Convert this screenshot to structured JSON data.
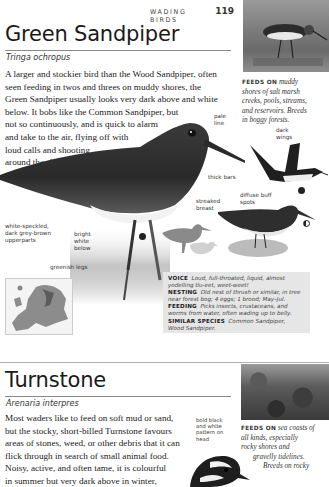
{
  "running_head": {
    "section": "WADING BIRDS",
    "page_number": "119"
  },
  "green_sandpiper": {
    "title": "Green Sandpiper",
    "latin": "Tringa ochropus",
    "body_lines": [
      "A larger and stockier bird than the Wood Sandpiper, often",
      "seen feeding in twos and threes on muddy shores, the",
      "Green Sandpiper usually looks very dark above and white",
      "below. It bobs like the Common Sandpiper, but",
      "not so continuously, and is quick to alarm",
      "and take to the air, flying off with",
      "loud calls and shooting",
      "around the sky."
    ],
    "feeds_on": {
      "label": "FEEDS ON",
      "lines": [
        "muddy",
        "shores of salt marsh",
        "creeks, pools, streams,",
        "and reservoirs. Breeds",
        "in boggy forests."
      ]
    },
    "annotations": {
      "pale_line": [
        "pale",
        "line"
      ],
      "dark_wings": [
        "dark",
        "wings"
      ],
      "thick_bars": "thick bars",
      "streaked_breast": [
        "streaked",
        "breast"
      ],
      "diffuse_buff_spots": [
        "diffuse buff",
        "spots"
      ],
      "upperparts": [
        "white-speckled,",
        "dark grey-brown",
        "upperparts"
      ],
      "bright_white_below": [
        "bright",
        "white",
        "below"
      ],
      "greenish_legs": "greenish legs"
    },
    "info": {
      "voice_label": "VOICE",
      "voice_lines": [
        "Loud, full-throated, liquid, almost",
        "yodelling tlu-eet, weet-weet!"
      ],
      "nesting_label": "NESTING",
      "nesting_lines": [
        "Old nest of thrush or similar, in tree",
        "near forest bog; 4 eggs; 1 brood; May–Jul."
      ],
      "feeding_label": "FEEDING",
      "feeding_lines": [
        "Picks insects, crustaceans, and",
        "worms from water, often wading up to belly."
      ],
      "similar_label": "SIMILAR SPECIES",
      "similar_lines": [
        "Common Sandpiper,",
        "Wood Sandpiper."
      ]
    }
  },
  "turnstone": {
    "title": "Turnstone",
    "latin": "Arenaria interpres",
    "body_lines": [
      "Most waders like to feed on soft mud or sand,",
      "but the stocky, short-billed Turnstone favours",
      "areas of stones, weed, or other debris that it can",
      "flick through in search of small animal food.",
      "Noisy, active, and often tame, it is colourful",
      "in summer but very dark above in winter,"
    ],
    "annotations": {
      "head_pattern": [
        "bold black",
        "and white",
        "pattern on",
        "head"
      ]
    },
    "feeds_on": {
      "label": "FEEDS ON",
      "lines": [
        "sea coasts of",
        "all kinds, especially",
        "rocky shores and",
        "gravelly tidelines.",
        "Breeds on rocky"
      ]
    }
  }
}
